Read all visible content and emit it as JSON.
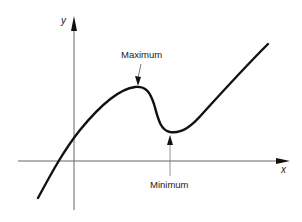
{
  "diagram": {
    "type": "function-graph",
    "axes": {
      "x_label": "x",
      "y_label": "y"
    },
    "annotations": {
      "maximum": "Maximum",
      "minimum": "Minimum"
    },
    "colors": {
      "curve": "#111111",
      "axes": "#555555",
      "background": "#ffffff"
    }
  }
}
